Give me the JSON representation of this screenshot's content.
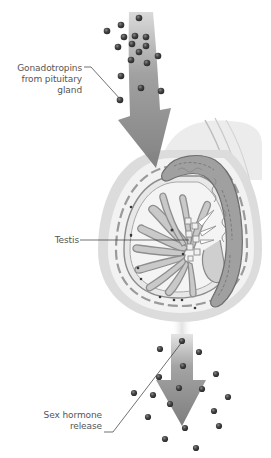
{
  "labels": {
    "gonadotropins": [
      "Gonadotropins",
      "from pituitary gland"
    ],
    "testis": "Testis",
    "sex_hormone": [
      "Sex hormone",
      "release"
    ]
  },
  "colors": {
    "arrow": "#8a8a8a",
    "molecule": "#3c3c3c",
    "scrotum": "#d9d9d9",
    "tubule": "#9a9a9a",
    "epididymis": "#7a7a7a",
    "leader_line": "#333333"
  },
  "molecules_in": [
    [
      139,
      18
    ],
    [
      121,
      25
    ],
    [
      107,
      31
    ],
    [
      124,
      37
    ],
    [
      135,
      36
    ],
    [
      146,
      37
    ],
    [
      118,
      47
    ],
    [
      132,
      44
    ],
    [
      146,
      46
    ],
    [
      139,
      52
    ],
    [
      158,
      56
    ],
    [
      131,
      60
    ],
    [
      147,
      63
    ],
    [
      121,
      76
    ],
    [
      141,
      88
    ],
    [
      161,
      91
    ],
    [
      120,
      100
    ]
  ],
  "molecules_out": [
    [
      182,
      341
    ],
    [
      160,
      349
    ],
    [
      199,
      352
    ],
    [
      183,
      366
    ],
    [
      216,
      374
    ],
    [
      159,
      377
    ],
    [
      179,
      388
    ],
    [
      202,
      389
    ],
    [
      134,
      393
    ],
    [
      153,
      395
    ],
    [
      228,
      397
    ],
    [
      170,
      404
    ],
    [
      214,
      411
    ],
    [
      148,
      417
    ],
    [
      185,
      428
    ],
    [
      219,
      426
    ],
    [
      165,
      439
    ],
    [
      196,
      448
    ]
  ]
}
